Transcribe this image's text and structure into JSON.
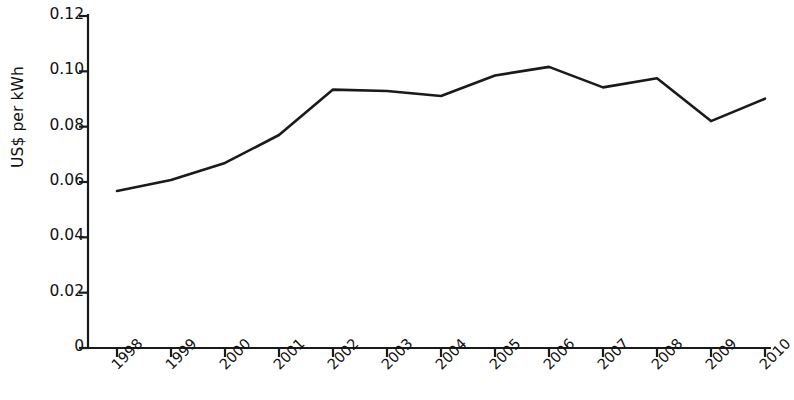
{
  "chart_data": {
    "type": "line",
    "title": "",
    "subtitle": "",
    "xlabel": "",
    "ylabel": "US$ per kWh",
    "categories": [
      "1998",
      "1999",
      "2000",
      "2001",
      "2002",
      "2003",
      "2004",
      "2005",
      "2006",
      "2007",
      "2008",
      "2009",
      "2010"
    ],
    "x": [
      1998,
      1999,
      2000,
      2001,
      2002,
      2003,
      2004,
      2005,
      2006,
      2007,
      2008,
      2009,
      2010
    ],
    "values": [
      0.0568,
      0.0607,
      0.0669,
      0.077,
      0.0934,
      0.0929,
      0.0911,
      0.0985,
      0.1016,
      0.0942,
      0.0975,
      0.082,
      0.0901
    ],
    "series": [
      {
        "name": "US$ per kWh",
        "values": [
          0.0568,
          0.0607,
          0.0669,
          0.077,
          0.0934,
          0.0929,
          0.0911,
          0.0985,
          0.1016,
          0.0942,
          0.0975,
          0.082,
          0.0901
        ],
        "color": "#1a1a1a"
      }
    ],
    "ylim": [
      0,
      0.12
    ],
    "yticks": [
      0,
      0.02,
      0.04,
      0.06,
      0.08,
      0.1,
      0.12
    ],
    "ytick_labels": [
      "0",
      "0.02",
      "0.04",
      "0.06",
      "0.08",
      "0.10",
      "0.12"
    ],
    "xtick_labels": [
      "1998",
      "1999",
      "2000",
      "2001",
      "2002",
      "2003",
      "2004",
      "2005",
      "2006",
      "2007",
      "2008",
      "2009",
      "2010"
    ],
    "grid": false,
    "legend": false,
    "legend_position": "none",
    "line_color": "#1a1a1a",
    "axis_color": "#1a1a1a",
    "background_color": "#ffffff",
    "markers": false,
    "xtick_rotation": -45
  }
}
